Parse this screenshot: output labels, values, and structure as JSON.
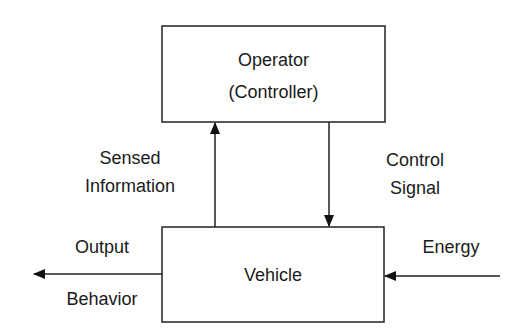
{
  "diagram": {
    "operator_box": {
      "line1": "Operator",
      "line2": "(Controller)"
    },
    "vehicle_box": {
      "label": "Vehicle"
    },
    "sensed_label": {
      "line1": "Sensed",
      "line2": "Information"
    },
    "control_label": {
      "line1": "Control",
      "line2": "Signal"
    },
    "output_label": {
      "line1": "Output",
      "line2": "Behavior"
    },
    "energy_label": "Energy"
  }
}
